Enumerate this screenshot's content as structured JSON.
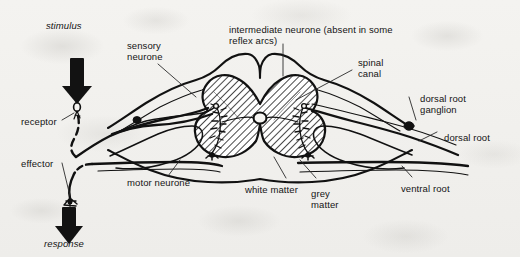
{
  "figure": {
    "kind": "biology-diagram",
    "ink_color": "#111111",
    "paper_color": "#f2f1ee",
    "hatch_color": "#1a1a1a"
  },
  "labels": {
    "stimulus": "stimulus",
    "response": "response",
    "receptor": "receptor",
    "effector": "effector",
    "sensory_neurone": "sensory\nneurone",
    "sensory_neurone_line1": "sensory",
    "sensory_neurone_line2": "neurone",
    "motor_neurone": "motor neurone",
    "intermediate_neurone_line1": "intermediate neurone (absent in some",
    "intermediate_neurone_line2": "reflex arcs)",
    "spinal_canal_line1": "spinal",
    "spinal_canal_line2": "canal",
    "dorsal_root_ganglion_line1": "dorsal root",
    "dorsal_root_ganglion_line2": "ganglion",
    "dorsal_root": "dorsal root",
    "ventral_root": "ventral root",
    "white_matter": "white matter",
    "grey_matter_line1": "grey",
    "grey_matter_line2": "matter"
  },
  "arrows": {
    "stimulus_direction": "down",
    "response_direction": "down"
  },
  "icons": {
    "stimulus_arrow": "down-arrow-icon",
    "response_arrow": "down-arrow-icon"
  }
}
